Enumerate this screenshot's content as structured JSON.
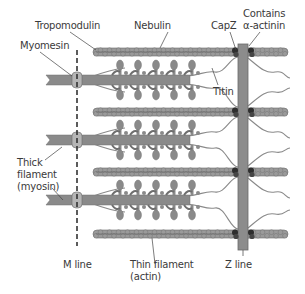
{
  "figure": {
    "colors": {
      "filament": "#8a8a8a",
      "filament_dark": "#6e6e6e",
      "actin_bead": "#9a9a9a",
      "actin_outline": "#6a6a6a",
      "capz": "#2e2e2e",
      "z_line": "#8c8c8c",
      "titin": "#8a8a8a",
      "leader": "#444444",
      "text": "#3a3a3a"
    },
    "labels": {
      "tropomodulin": "Tropomodulin",
      "nebulin": "Nebulin",
      "capz": "CapZ",
      "contains_1": "Contains",
      "contains_2": "α-actinin",
      "myomesin": "Myomesin",
      "titin": "Titin",
      "thick_1": "Thick",
      "thick_2": "filament",
      "thick_3": "(myosin)",
      "m_line": "M line",
      "thin_1": "Thin filament",
      "thin_2": "(actin)",
      "z_line": "Z line"
    },
    "layout": {
      "thin_filament_y": [
        52,
        112,
        172,
        234
      ],
      "thick_filament_y": [
        80,
        140,
        200
      ],
      "m_line_x": 77,
      "z_line_x": [
        238,
        248
      ]
    }
  }
}
